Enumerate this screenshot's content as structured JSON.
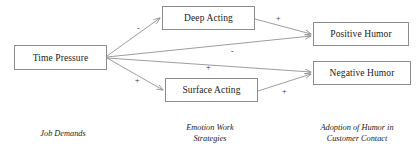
{
  "figure": {
    "type": "path-model-diagram",
    "background": "#ffffff",
    "line_color": "#8b8b8b",
    "text_color": "#1a1a1a"
  },
  "nodes": [
    {
      "id": "time_pressure",
      "label": "Time Pressure",
      "x": 14,
      "y": 45,
      "w": 93,
      "h": 25
    },
    {
      "id": "deep_acting",
      "label": "Deep Acting",
      "x": 162,
      "y": 6,
      "w": 93,
      "h": 24
    },
    {
      "id": "surface_acting",
      "label": "Surface Acting",
      "x": 165,
      "y": 78,
      "w": 93,
      "h": 24
    },
    {
      "id": "positive_humor",
      "label": "Positive Humor",
      "x": 313,
      "y": 22,
      "w": 96,
      "h": 24
    },
    {
      "id": "negative_humor",
      "label": "Negative Humor",
      "x": 313,
      "y": 61,
      "w": 98,
      "h": 24
    }
  ],
  "edges": [
    {
      "id": "tp-da",
      "from": "time_pressure",
      "to": "deep_acting",
      "sign": "-",
      "sign_x": 137,
      "sign_y": 25
    },
    {
      "id": "tp-sa",
      "from": "time_pressure",
      "to": "surface_acting",
      "sign": "+",
      "sign_x": 135,
      "sign_y": 77
    },
    {
      "id": "tp-ph",
      "from": "time_pressure",
      "to": "positive_humor",
      "sign": "-",
      "sign_x": 231,
      "sign_y": 48
    },
    {
      "id": "tp-nh",
      "from": "time_pressure",
      "to": "negative_humor",
      "sign": "+",
      "sign_x": 206,
      "sign_y": 64
    },
    {
      "id": "da-ph",
      "from": "deep_acting",
      "to": "positive_humor",
      "sign": "+",
      "sign_x": 276,
      "sign_y": 15
    },
    {
      "id": "sa-nh",
      "from": "surface_acting",
      "to": "negative_humor",
      "sign": "+",
      "sign_x": 282,
      "sign_y": 88
    }
  ],
  "column_labels": [
    {
      "id": "job_demands",
      "text": "Job Demands",
      "x": 8,
      "y": 128,
      "w": 110
    },
    {
      "id": "emotion_work",
      "text": "Emotion Work\nStrategies",
      "x": 155,
      "y": 122,
      "w": 110
    },
    {
      "id": "humor_adoption",
      "text": "Adoption of Humor in\nCustomer Contact",
      "x": 298,
      "y": 122,
      "w": 118
    }
  ]
}
